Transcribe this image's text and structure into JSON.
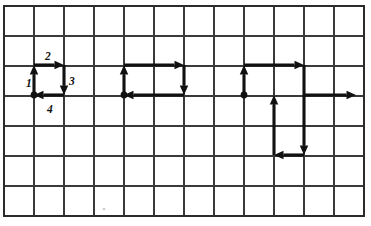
{
  "figure": {
    "canvas": {
      "width": 371,
      "height": 226,
      "background": "#ffffff"
    },
    "grid": {
      "columns": 12,
      "rows": 7,
      "cell_size": 30,
      "origin_x": 4,
      "origin_y": 6,
      "line_color": "#3a3a3a",
      "border_color": "#2b2b2b",
      "visible": true
    },
    "style": {
      "vector_color": "#111111",
      "vector_width": 3.1,
      "label_color": "#111111",
      "dot_color": "#111111"
    },
    "labels": [
      {
        "id": "label-1",
        "text": "1",
        "x": 26,
        "y": 87
      },
      {
        "id": "label-2",
        "text": "2",
        "x": 45,
        "y": 60
      },
      {
        "id": "label-3",
        "text": "3",
        "x": 69,
        "y": 85
      },
      {
        "id": "label-4",
        "text": "4",
        "x": 47,
        "y": 113
      }
    ],
    "diagrams": [
      {
        "id": "diagram-left",
        "name": "unit-square-loop",
        "start_dot": {
          "x": 34,
          "y": 95
        },
        "vectors": [
          {
            "id": "v1",
            "label": "1",
            "dir": "up",
            "x1": 34,
            "y1": 95,
            "x2": 34,
            "y2": 65
          },
          {
            "id": "v2",
            "label": "2",
            "dir": "right",
            "x1": 34,
            "y1": 65,
            "x2": 64,
            "y2": 65
          },
          {
            "id": "v3",
            "label": "3",
            "dir": "down",
            "x1": 64,
            "y1": 65,
            "x2": 64,
            "y2": 95
          },
          {
            "id": "v4",
            "label": "4",
            "dir": "left",
            "x1": 64,
            "y1": 95,
            "x2": 34,
            "y2": 95
          }
        ]
      },
      {
        "id": "diagram-middle",
        "name": "two-by-one-rectangle-loop",
        "start_dot": {
          "x": 124,
          "y": 95
        },
        "vectors": [
          {
            "id": "m1",
            "label": "",
            "dir": "up",
            "x1": 124,
            "y1": 95,
            "x2": 124,
            "y2": 65
          },
          {
            "id": "m2",
            "label": "",
            "dir": "right",
            "x1": 124,
            "y1": 65,
            "x2": 184,
            "y2": 65
          },
          {
            "id": "m3",
            "label": "",
            "dir": "down",
            "x1": 184,
            "y1": 65,
            "x2": 184,
            "y2": 95
          },
          {
            "id": "m4",
            "label": "",
            "dir": "left",
            "x1": 184,
            "y1": 95,
            "x2": 124,
            "y2": 95
          }
        ]
      },
      {
        "id": "diagram-right",
        "name": "open-path-with-resultant",
        "start_dot": {
          "x": 244,
          "y": 95
        },
        "vectors": [
          {
            "id": "r1",
            "label": "",
            "dir": "up",
            "x1": 244,
            "y1": 95,
            "x2": 244,
            "y2": 65
          },
          {
            "id": "r2",
            "label": "",
            "dir": "right",
            "x1": 244,
            "y1": 65,
            "x2": 304,
            "y2": 65
          },
          {
            "id": "r3",
            "label": "",
            "dir": "down",
            "x1": 304,
            "y1": 65,
            "x2": 304,
            "y2": 155
          },
          {
            "id": "r4",
            "label": "",
            "dir": "left",
            "x1": 304,
            "y1": 155,
            "x2": 274,
            "y2": 155
          },
          {
            "id": "r5",
            "label": "",
            "dir": "up",
            "x1": 274,
            "y1": 155,
            "x2": 274,
            "y2": 95
          },
          {
            "id": "r6",
            "label": "",
            "dir": "right",
            "x1": 304,
            "y1": 95,
            "x2": 356,
            "y2": 95
          }
        ]
      }
    ]
  }
}
